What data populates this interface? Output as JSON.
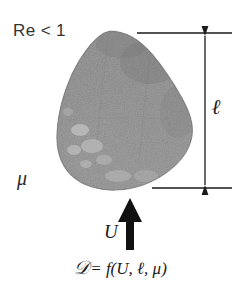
{
  "figure": {
    "background_color": "#ffffff",
    "width": 241,
    "height": 286
  },
  "labels": {
    "reynolds": "Re < 1",
    "viscosity": "μ",
    "length": "ℓ",
    "velocity": "U",
    "equation_lhs": "𝒟",
    "equation_rhs": "= f(U, ℓ, μ)",
    "equation_full": "𝒟 = f(U, ℓ, μ)"
  },
  "body": {
    "name": "irregular-particle",
    "description": "grainy grey irregular solid body",
    "fill_color": "#8d8d8d",
    "edge_color": "#6e6e6e",
    "highlight_color": "#c8c8c8",
    "bounds": {
      "left": 57,
      "top": 31,
      "right": 193,
      "bottom": 190
    }
  },
  "annotations": {
    "dimension_line": {
      "name": "length-dimension",
      "color": "#1a1a1a",
      "x": 205,
      "top_y": 33,
      "bottom_y": 188,
      "extension_top_x1": 137,
      "extension_top_x2": 232,
      "extension_bottom_x1": 152,
      "extension_bottom_x2": 232,
      "measures": "ℓ"
    },
    "flow_arrow": {
      "name": "velocity-arrow",
      "color": "#111111",
      "direction": "up",
      "x": 130,
      "tail_y": 250,
      "head_y": 200,
      "measures": "U"
    }
  },
  "colors": {
    "ink": "#1a1a1a",
    "body_grey": "#8d8d8d",
    "background": "#ffffff"
  }
}
